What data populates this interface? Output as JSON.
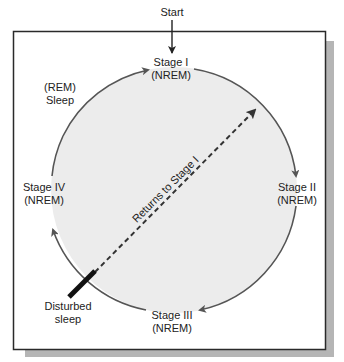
{
  "start_label": "Start",
  "stages": {
    "stage1": {
      "line1": "Stage I",
      "line2": "(NREM)"
    },
    "stage2": {
      "line1": "Stage II",
      "line2": "(NREM)"
    },
    "stage3": {
      "line1": "Stage III",
      "line2": "(NREM)"
    },
    "stage4": {
      "line1": "Stage IV",
      "line2": "(NREM)"
    }
  },
  "rem": {
    "line1": "(REM)",
    "line2": "Sleep"
  },
  "disturbed": {
    "line1": "Disturbed",
    "line2": "sleep"
  },
  "return_label": "Returns to Stage I",
  "colors": {
    "frame": "#2a2a2a",
    "shadow": "#b5b5b5",
    "circle_fill": "#ececec",
    "arc": "#555555",
    "text": "#222222"
  }
}
